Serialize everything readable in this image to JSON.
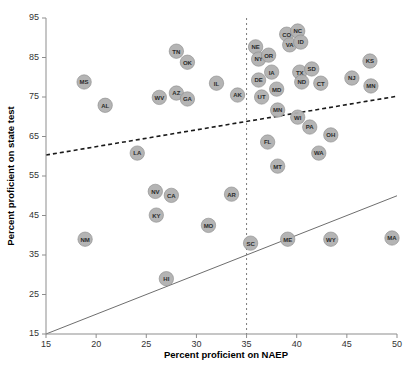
{
  "chart_data": {
    "type": "scatter",
    "title": "",
    "xlabel": "Percent proficient on NAEP",
    "ylabel": "Percent proficient on state test",
    "xlim": [
      15,
      50
    ],
    "ylim": [
      15,
      95
    ],
    "xticks": [
      15,
      20,
      25,
      30,
      35,
      40,
      45,
      50
    ],
    "yticks": [
      15,
      25,
      35,
      45,
      55,
      65,
      75,
      85,
      95
    ],
    "grid": false,
    "legend": "none",
    "point_label_field": "state",
    "points": [
      {
        "state": "MS",
        "x": 18.8,
        "y": 78.8
      },
      {
        "state": "AL",
        "x": 20.9,
        "y": 72.9
      },
      {
        "state": "NM",
        "x": 18.9,
        "y": 39.0
      },
      {
        "state": "LA",
        "x": 24.1,
        "y": 60.8
      },
      {
        "state": "NV",
        "x": 25.9,
        "y": 51.1
      },
      {
        "state": "KY",
        "x": 26.0,
        "y": 45.1
      },
      {
        "state": "CA",
        "x": 27.5,
        "y": 50.1
      },
      {
        "state": "HI",
        "x": 27.0,
        "y": 29.0
      },
      {
        "state": "WV",
        "x": 26.3,
        "y": 74.9
      },
      {
        "state": "TN",
        "x": 28.0,
        "y": 86.6
      },
      {
        "state": "OK",
        "x": 29.1,
        "y": 83.8
      },
      {
        "state": "AZ",
        "x": 28.0,
        "y": 76.0
      },
      {
        "state": "GA",
        "x": 29.1,
        "y": 74.5
      },
      {
        "state": "MO",
        "x": 31.2,
        "y": 42.5
      },
      {
        "state": "IL",
        "x": 32.0,
        "y": 78.5
      },
      {
        "state": "AK",
        "x": 34.1,
        "y": 75.5
      },
      {
        "state": "AR",
        "x": 33.5,
        "y": 50.4
      },
      {
        "state": "SC",
        "x": 35.4,
        "y": 38.0
      },
      {
        "state": "NE",
        "x": 35.9,
        "y": 87.7
      },
      {
        "state": "NY",
        "x": 36.2,
        "y": 84.6
      },
      {
        "state": "OR",
        "x": 37.2,
        "y": 85.6
      },
      {
        "state": "CO",
        "x": 39.0,
        "y": 90.9
      },
      {
        "state": "NC",
        "x": 40.1,
        "y": 91.7
      },
      {
        "state": "VA",
        "x": 39.3,
        "y": 88.2
      },
      {
        "state": "ID",
        "x": 40.4,
        "y": 88.9
      },
      {
        "state": "IA",
        "x": 37.5,
        "y": 81.3
      },
      {
        "state": "DE",
        "x": 36.2,
        "y": 79.3
      },
      {
        "state": "MD",
        "x": 38.0,
        "y": 77.0
      },
      {
        "state": "TX",
        "x": 40.3,
        "y": 81.3
      },
      {
        "state": "SD",
        "x": 41.5,
        "y": 82.1
      },
      {
        "state": "ND",
        "x": 40.5,
        "y": 78.8
      },
      {
        "state": "CT",
        "x": 42.4,
        "y": 78.5
      },
      {
        "state": "KS",
        "x": 47.3,
        "y": 84.1
      },
      {
        "state": "NJ",
        "x": 45.5,
        "y": 79.8
      },
      {
        "state": "MN",
        "x": 47.4,
        "y": 77.8
      },
      {
        "state": "UT",
        "x": 36.5,
        "y": 75.0
      },
      {
        "state": "MN2",
        "x": 38.1,
        "y": 71.7
      },
      {
        "state": "WI",
        "x": 40.1,
        "y": 69.9
      },
      {
        "state": "PA",
        "x": 41.3,
        "y": 67.4
      },
      {
        "state": "OH",
        "x": 43.4,
        "y": 65.4
      },
      {
        "state": "FL",
        "x": 37.1,
        "y": 63.6
      },
      {
        "state": "WA",
        "x": 42.2,
        "y": 60.8
      },
      {
        "state": "MT",
        "x": 38.1,
        "y": 57.5
      },
      {
        "state": "ME",
        "x": 39.1,
        "y": 39.0
      },
      {
        "state": "WY",
        "x": 43.4,
        "y": 39.0
      },
      {
        "state": "MA",
        "x": 49.5,
        "y": 39.3
      }
    ],
    "identity_line": {
      "label": "y = x",
      "x0": 15,
      "y0": 15,
      "x1": 50,
      "y1": 50,
      "style": "solid"
    },
    "fit_line": {
      "label": "trend",
      "x0": 15,
      "y0": 60.3,
      "x1": 50,
      "y1": 75.2,
      "style": "dashed"
    },
    "reference_vline": {
      "label": "NAEP 35",
      "x": 35,
      "style": "dashed"
    }
  }
}
